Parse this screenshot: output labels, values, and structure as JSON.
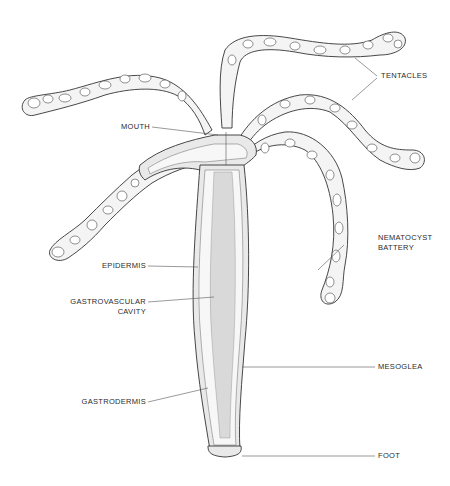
{
  "diagram": {
    "labels": {
      "tentacles": "TENTACLES",
      "mouth": "MOUTH",
      "nematocyst_line1": "NEMATOCYST",
      "nematocyst_line2": "BATTERY",
      "epidermis": "EPIDERMIS",
      "gastrovascular_line1": "GASTROVASCULAR",
      "gastrovascular_line2": "CAVITY",
      "mesoglea": "MESOGLEA",
      "gastrodermis": "GASTRODERMIS",
      "foot": "FOOT"
    },
    "colors": {
      "background": "#ffffff",
      "ink": "#333333",
      "cavity_fill": "#d9d9d9",
      "label_text": "#2a2a2a"
    }
  }
}
